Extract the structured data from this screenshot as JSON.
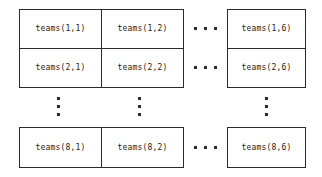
{
  "diagram": {
    "colors": {
      "background": "#ffffff",
      "border": "#2b2b2b",
      "text": "#1b1b1b",
      "dot": "#2b2b2b"
    },
    "rows": [
      {
        "row_index": "1",
        "cells": [
          {
            "label": "teams(1,1)",
            "column": "1"
          },
          {
            "label": "teams(1,2)",
            "column": "2"
          },
          {
            "label": "teams(1,6)",
            "column": "6"
          }
        ],
        "horizontal_ellipsis": "• • •"
      },
      {
        "row_index": "2",
        "cells": [
          {
            "label": "teams(2,1)",
            "column": "1"
          },
          {
            "label": "teams(2,2)",
            "column": "2"
          },
          {
            "label": "teams(2,6)",
            "column": "6"
          }
        ],
        "horizontal_ellipsis": "• • •"
      },
      {
        "row_index": "8",
        "cells": [
          {
            "label": "teams(8,1)",
            "column": "1"
          },
          {
            "label": "teams(8,2)",
            "column": "2"
          },
          {
            "label": "teams(8,6)",
            "column": "6"
          }
        ],
        "horizontal_ellipsis": "• • •"
      }
    ],
    "vertical_ellipses": [
      {
        "under_column": "1",
        "glyph": "⋮"
      },
      {
        "under_column": "2",
        "glyph": "⋮"
      },
      {
        "under_column": "6",
        "glyph": "⋮"
      }
    ]
  }
}
